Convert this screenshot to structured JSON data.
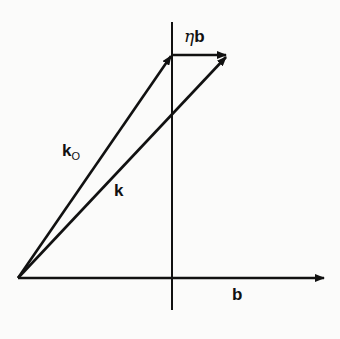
{
  "diagram": {
    "labels": {
      "eta_symbol": "η",
      "eta_b_vector": "b",
      "k0_main": "k",
      "k0_sub": "O",
      "k": "k",
      "b": "b"
    },
    "colors": {
      "line": "#111111",
      "background": "#fbfbfa"
    }
  }
}
